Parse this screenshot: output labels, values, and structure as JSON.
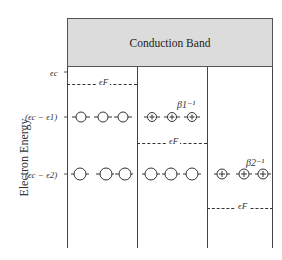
{
  "diagram": {
    "band_label": "Conduction Band",
    "y_axis_title": "Electron Energy",
    "levels": {
      "ec": "ϵc",
      "level1": "(ϵc − ϵ1)",
      "level2": "(ϵc − ϵ2)"
    },
    "columns": [
      {
        "fermi_label": "ϵF",
        "row1": "empty",
        "row2": "empty"
      },
      {
        "fermi_label": "ϵF",
        "row1": "ionized",
        "row2": "empty",
        "annotation": "β1⁻¹"
      },
      {
        "fermi_label": "ϵF",
        "row1": "none",
        "row2": "ionized",
        "annotation": "β2⁻¹"
      }
    ],
    "colors": {
      "band_fill": "#dcdcdc",
      "line": "#444444"
    }
  }
}
